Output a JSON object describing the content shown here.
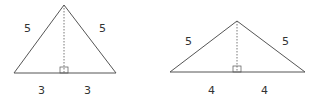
{
  "colors": {
    "stroke": "#555555",
    "text": "#333333",
    "background": "#ffffff"
  },
  "triangles": [
    {
      "apex": [
        64,
        5
      ],
      "left": [
        14,
        73
      ],
      "right": [
        116,
        73
      ],
      "labels": {
        "left_side": "5",
        "right_side": "5",
        "left_half": "3",
        "right_half": "3"
      },
      "label_pos": {
        "left_side": [
          28,
          32
        ],
        "right_side": [
          103,
          32
        ],
        "left_half": [
          42,
          94
        ],
        "right_half": [
          88,
          94
        ]
      }
    },
    {
      "apex": [
        237,
        21
      ],
      "left": [
        170,
        72
      ],
      "right": [
        305,
        72
      ],
      "labels": {
        "left_side": "5",
        "right_side": "5",
        "left_half": "4",
        "right_half": "4"
      },
      "label_pos": {
        "left_side": [
          188,
          45
        ],
        "right_side": [
          285,
          45
        ],
        "left_half": [
          211,
          94
        ],
        "right_half": [
          264,
          94
        ]
      }
    }
  ]
}
